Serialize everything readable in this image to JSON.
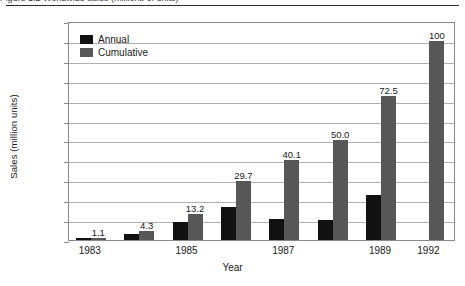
{
  "caption": "Figure 1.2   Worldwide sales (millions of units)",
  "chart_data": {
    "type": "bar",
    "title": "",
    "xlabel": "Year",
    "ylabel": "Sales (million units)",
    "ylim": [
      0,
      110
    ],
    "ytick_step": 10,
    "yticks": [
      0,
      10,
      20,
      30,
      40,
      50,
      60,
      70,
      80,
      90,
      100,
      110
    ],
    "grid": true,
    "legend_position": "top-left",
    "categories": [
      "1983",
      "1984",
      "1985",
      "1986",
      "1987",
      "1988",
      "1989",
      "1992"
    ],
    "xtick_labels_shown": [
      "1983",
      "1985",
      "1987",
      "1989",
      "1992"
    ],
    "series": [
      {
        "name": "Annual",
        "color": "#111111",
        "values": [
          1.1,
          3.2,
          8.9,
          16.5,
          10.4,
          9.9,
          22.5,
          null
        ]
      },
      {
        "name": "Cumulative",
        "color": "#575757",
        "values": [
          1.1,
          4.3,
          13.2,
          29.7,
          40.1,
          50.0,
          72.5,
          100
        ],
        "data_labels": [
          "1.1",
          "4.3",
          "13.2",
          "29.7",
          "40.1",
          "50.0",
          "72.5",
          "100"
        ]
      }
    ]
  },
  "legend": {
    "items": [
      {
        "label": "Annual",
        "color": "#111111"
      },
      {
        "label": "Cumulative",
        "color": "#575757"
      }
    ]
  }
}
